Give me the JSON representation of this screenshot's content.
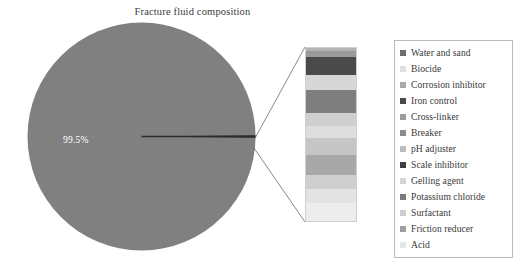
{
  "chart_data": {
    "type": "pie",
    "title": "Fracture fluid composition",
    "xlabel": "",
    "ylabel": "",
    "grid": false,
    "legend_position": "right",
    "pie": {
      "categories": [
        "Water and sand",
        "Other additives"
      ],
      "values": [
        99.5,
        0.5
      ],
      "labels": [
        "99.5%",
        ""
      ],
      "start_angle_deg": 0,
      "main_slice_color": "#808080",
      "small_slice_color": "#2f2f2f"
    },
    "breakout_bar": {
      "type": "bar",
      "orientation": "vertical-stacked",
      "note": "Exploded detail of the 0.5% additives slice",
      "categories": [
        "Biocide",
        "Corrosion inhibitor",
        "Iron control",
        "Cross-linker",
        "Breaker",
        "pH adjuster",
        "Scale inhibitor",
        "Gelling agent",
        "Potassium chloride",
        "Surfactant",
        "Friction reducer",
        "Acid"
      ],
      "values": [
        1.9,
        3.4,
        10.3,
        8.6,
        13.1,
        8.0,
        6.9,
        9.7,
        11.4,
        8.0,
        8.6,
        10.1
      ],
      "colors": [
        "#b3b3b3",
        "#9a9a9a",
        "#4a4a4a",
        "#d7d7d7",
        "#7e7e7e",
        "#cfcfcf",
        "#dedede",
        "#c6c6c6",
        "#a8a8a8",
        "#cfcfcf",
        "#e3e3e3",
        "#ededed"
      ]
    },
    "legend_entries": [
      {
        "label": "Water and sand",
        "color": "#6e6e6e"
      },
      {
        "label": "Biocide",
        "color": "#e0e0e0"
      },
      {
        "label": "Corrosion inhibitor",
        "color": "#a8a8a8"
      },
      {
        "label": "Iron control",
        "color": "#4a4a4a"
      },
      {
        "label": "Cross-linker",
        "color": "#9d9d9d"
      },
      {
        "label": "Breaker",
        "color": "#8a8a8a"
      },
      {
        "label": "pH adjuster",
        "color": "#bdbdbd"
      },
      {
        "label": "Scale inhibitor",
        "color": "#3f3f3f"
      },
      {
        "label": "Gelling agent",
        "color": "#d5d5d5"
      },
      {
        "label": "Potassium chloride",
        "color": "#7a7a7a"
      },
      {
        "label": "Surfactant",
        "color": "#cdcdcd"
      },
      {
        "label": "Friction reducer",
        "color": "#9e9e9e"
      },
      {
        "label": "Acid",
        "color": "#e6e6e6"
      }
    ]
  }
}
